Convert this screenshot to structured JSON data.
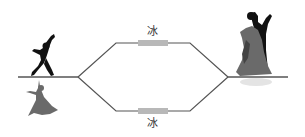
{
  "diagram": {
    "top_block_label": "冰",
    "bottom_block_label": "冰",
    "colors": {
      "line": "#555555",
      "block": "#b8b8b8",
      "figure_dark": "#111111",
      "figure_gray": "#6a6a6a"
    }
  }
}
